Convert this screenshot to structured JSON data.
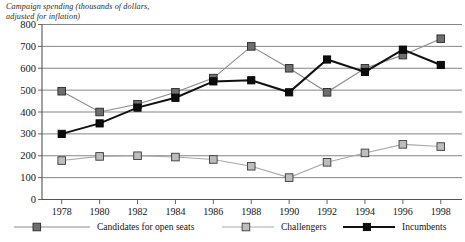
{
  "chart_data": {
    "type": "line",
    "title": "Campaign spending (thousands of dollars, adjusted for inflation)",
    "title_line1": "Campaign spending (thousands of dollars,",
    "title_line2": "adjusted for inflation)",
    "xlabel": "",
    "ylabel": "",
    "ylim": [
      0,
      800
    ],
    "ytick_step": 100,
    "grid": true,
    "legend_position": "bottom",
    "categories": [
      1978,
      1980,
      1982,
      1984,
      1986,
      1988,
      1990,
      1992,
      1994,
      1996,
      1998
    ],
    "xtick_labels": [
      "1978",
      "1980",
      "1982",
      "1984",
      "1986",
      "1988",
      "1990",
      "1992",
      "1994",
      "1996",
      "1998"
    ],
    "ytick_labels": [
      "0",
      "100",
      "200",
      "300",
      "400",
      "500",
      "600",
      "700",
      "800"
    ],
    "series": [
      {
        "name": "Candidates for open seats",
        "color": "#6e6e6e",
        "line_color": "#8b8b8b",
        "values": [
          495,
          400,
          435,
          490,
          555,
          700,
          600,
          490,
          600,
          660,
          735
        ]
      },
      {
        "name": "Challengers",
        "color": "#bdbdbd",
        "line_color": "#a8a8a8",
        "values": [
          178,
          197,
          200,
          194,
          183,
          152,
          100,
          170,
          213,
          252,
          242
        ]
      },
      {
        "name": "Incumbents",
        "color": "#0d0d0d",
        "line_color": "#111111",
        "values": [
          300,
          348,
          420,
          465,
          540,
          545,
          490,
          640,
          583,
          685,
          615
        ]
      }
    ]
  }
}
